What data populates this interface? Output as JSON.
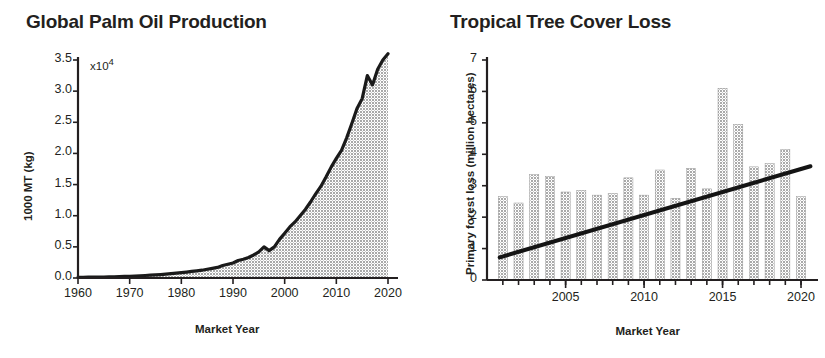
{
  "figure": {
    "panels": [
      {
        "id": "global-palm-oil-production",
        "title": "Global Palm Oil Production"
      },
      {
        "id": "tropical-tree-cover-loss",
        "title": "Tropical Tree Cover Loss"
      }
    ]
  },
  "chart_data": [
    {
      "type": "area",
      "title": "Global Palm Oil Production",
      "xlabel": "Market Year",
      "ylabel": "1000 MT (kg)",
      "y_multiplier_note": "x10",
      "y_multiplier_exponent": "4",
      "xlim": [
        1960,
        2021
      ],
      "ylim": [
        0.0,
        3.6
      ],
      "grid": false,
      "legend": "none",
      "xticks": [
        1960,
        1970,
        1980,
        1990,
        2000,
        2010,
        2020
      ],
      "xtick_labels": [
        "1960",
        "1970",
        "1980",
        "1990",
        "2000",
        "2010",
        "2020"
      ],
      "yticks": [
        0.0,
        0.5,
        1.0,
        1.5,
        2.0,
        2.5,
        3.0,
        3.5
      ],
      "ytick_labels": [
        "0.0",
        "0.5",
        "1.0",
        "1.5",
        "2.0",
        "2.5",
        "3.0",
        "3.5"
      ],
      "series": [
        {
          "name": "Palm oil production",
          "x": [
            1960,
            1961,
            1962,
            1963,
            1964,
            1965,
            1966,
            1967,
            1968,
            1969,
            1970,
            1971,
            1972,
            1973,
            1974,
            1975,
            1976,
            1977,
            1978,
            1979,
            1980,
            1981,
            1982,
            1983,
            1984,
            1985,
            1986,
            1987,
            1988,
            1989,
            1990,
            1991,
            1992,
            1993,
            1994,
            1995,
            1996,
            1997,
            1998,
            1999,
            2000,
            2001,
            2002,
            2003,
            2004,
            2005,
            2006,
            2007,
            2008,
            2009,
            2010,
            2011,
            2012,
            2013,
            2014,
            2015,
            2016,
            2017,
            2018,
            2019,
            2020
          ],
          "values": [
            0.01,
            0.012,
            0.013,
            0.014,
            0.015,
            0.016,
            0.018,
            0.02,
            0.022,
            0.025,
            0.028,
            0.032,
            0.036,
            0.04,
            0.045,
            0.05,
            0.055,
            0.062,
            0.07,
            0.078,
            0.086,
            0.095,
            0.105,
            0.115,
            0.125,
            0.14,
            0.155,
            0.17,
            0.2,
            0.22,
            0.24,
            0.28,
            0.3,
            0.33,
            0.37,
            0.42,
            0.5,
            0.44,
            0.5,
            0.62,
            0.72,
            0.82,
            0.9,
            1.0,
            1.1,
            1.22,
            1.35,
            1.47,
            1.62,
            1.78,
            1.92,
            2.05,
            2.25,
            2.48,
            2.72,
            2.88,
            3.25,
            3.1,
            3.35,
            3.5,
            3.6
          ]
        }
      ]
    },
    {
      "type": "bar",
      "title": "Tropical Tree Cover Loss",
      "xlabel": "Market Year",
      "ylabel": "Primary forest loss (million hectares)",
      "xlim": [
        2000.5,
        2020.7
      ],
      "ylim": [
        0,
        7
      ],
      "grid": false,
      "legend": "none",
      "xticks": [
        2005,
        2010,
        2015,
        2020
      ],
      "xtick_labels": [
        "2005",
        "2010",
        "2015",
        "2020"
      ],
      "yticks": [
        0,
        1,
        2,
        3,
        4,
        5,
        6,
        7
      ],
      "ytick_labels": [
        "0",
        "1",
        "2",
        "3",
        "4",
        "5",
        "6",
        "7"
      ],
      "categories": [
        2001,
        2002,
        2003,
        2004,
        2005,
        2006,
        2007,
        2008,
        2009,
        2010,
        2011,
        2012,
        2013,
        2014,
        2015,
        2016,
        2017,
        2018,
        2019,
        2020
      ],
      "values": [
        2.65,
        2.45,
        3.35,
        3.3,
        2.8,
        2.85,
        2.7,
        2.75,
        3.25,
        2.7,
        3.5,
        2.6,
        3.55,
        2.9,
        6.1,
        4.95,
        3.6,
        3.7,
        4.15,
        2.65
      ],
      "bars": [
        {
          "year": 2001,
          "value": 2.65
        },
        {
          "year": 2002,
          "value": 2.45
        },
        {
          "year": 2003,
          "value": 3.35
        },
        {
          "year": 2004,
          "value": 3.3
        },
        {
          "year": 2005,
          "value": 2.8
        },
        {
          "year": 2006,
          "value": 2.85
        },
        {
          "year": 2007,
          "value": 2.7
        },
        {
          "year": 2008,
          "value": 2.75
        },
        {
          "year": 2009,
          "value": 3.25
        },
        {
          "year": 2010,
          "value": 2.7
        },
        {
          "year": 2011,
          "value": 3.5
        },
        {
          "year": 2012,
          "value": 2.6
        },
        {
          "year": 2013,
          "value": 3.55
        },
        {
          "year": 2014,
          "value": 2.9
        },
        {
          "year": 2015,
          "value": 6.1
        },
        {
          "year": 2016,
          "value": 4.95
        },
        {
          "year": 2017,
          "value": 3.6
        },
        {
          "year": 2018,
          "value": 3.7
        },
        {
          "year": 2019,
          "value": 4.15
        },
        {
          "year": 2020,
          "value": 2.65
        }
      ],
      "trendline": {
        "name": "Linear trend",
        "x": [
          2000.8,
          2020.6
        ],
        "y": [
          0.72,
          3.62
        ]
      }
    }
  ]
}
